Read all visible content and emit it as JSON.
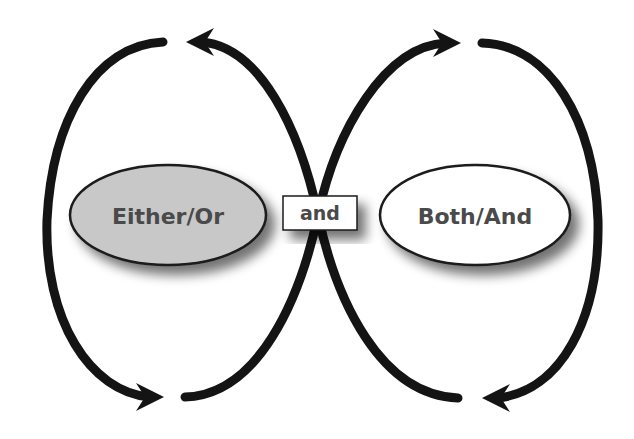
{
  "diagram": {
    "type": "polarity-map",
    "nodes": {
      "left": {
        "label": "Either/Or",
        "fill": "#c8c8c8",
        "stroke": "#1a1a1a"
      },
      "center": {
        "label": "and",
        "fill": "#ffffff",
        "stroke": "#1a1a1a"
      },
      "right": {
        "label": "Both/And",
        "fill": "#ffffff",
        "stroke": "#1a1a1a"
      }
    },
    "arrows": [
      {
        "name": "top-left-arrow",
        "direction": "left"
      },
      {
        "name": "top-right-arrow",
        "direction": "right"
      },
      {
        "name": "bottom-left-arrow",
        "direction": "right"
      },
      {
        "name": "bottom-right-arrow",
        "direction": "left"
      }
    ],
    "colors": {
      "loop": "#141414",
      "text": "#4a4a4a",
      "background": "#ffffff"
    }
  }
}
